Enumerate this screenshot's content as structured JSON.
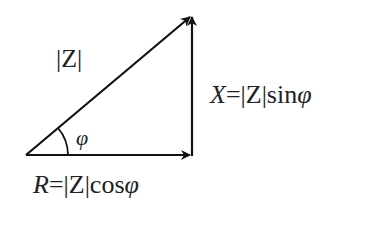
{
  "diagram": {
    "labels": {
      "hypotenuse": "|Z|",
      "angle": "φ",
      "vertical": {
        "var": "X",
        "eq": "=|Z|sin",
        "phi": "φ"
      },
      "horizontal": {
        "var": "R",
        "eq": "=|Z|cos",
        "phi": "φ"
      }
    },
    "vertices": {
      "origin": [
        26,
        155
      ],
      "right": [
        192,
        155
      ],
      "top": [
        192,
        15
      ]
    },
    "stroke_color": "#111111"
  }
}
